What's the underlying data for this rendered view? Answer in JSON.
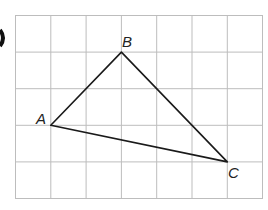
{
  "diagram": {
    "type": "triangle-on-grid",
    "grid": {
      "columns": 7,
      "rows": 5,
      "line_color": "#b8b8b8"
    },
    "points": [
      {
        "label": "A",
        "col": 1,
        "row": 3
      },
      {
        "label": "B",
        "col": 3,
        "row": 1
      },
      {
        "label": "C",
        "col": 6,
        "row": 4
      }
    ],
    "edges": [
      [
        "A",
        "B"
      ],
      [
        "B",
        "C"
      ],
      [
        "A",
        "C"
      ]
    ],
    "labels": {
      "a": "A",
      "b": "B",
      "c": "C"
    }
  }
}
